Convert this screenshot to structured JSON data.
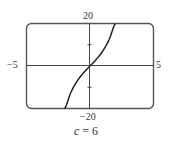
{
  "chart_data": {
    "type": "line",
    "title": "",
    "caption_var": "c",
    "caption_eq": "=",
    "caption_value": "6",
    "caption": "c = 6",
    "xlabel": "",
    "ylabel": "",
    "xlim": [
      -5,
      5
    ],
    "ylim": [
      -20,
      20
    ],
    "x_tick_labels": {
      "min": "−5",
      "max": "5"
    },
    "y_tick_labels": {
      "max": "20",
      "min": "−20"
    },
    "y_ticks": [
      -10,
      10
    ],
    "grid": false,
    "series": [
      {
        "name": "f(x) = x^3 + 6x",
        "x": [
          -2.0,
          -1.5,
          -1.0,
          -0.5,
          0.0,
          0.5,
          1.0,
          1.5,
          2.0
        ],
        "y": [
          -20.0,
          -12.375,
          -7.0,
          -3.125,
          0.0,
          3.125,
          7.0,
          12.375,
          20.0
        ]
      }
    ],
    "colors": {
      "axis": "#444444",
      "curve": "#222222",
      "frame": "#555555"
    }
  }
}
